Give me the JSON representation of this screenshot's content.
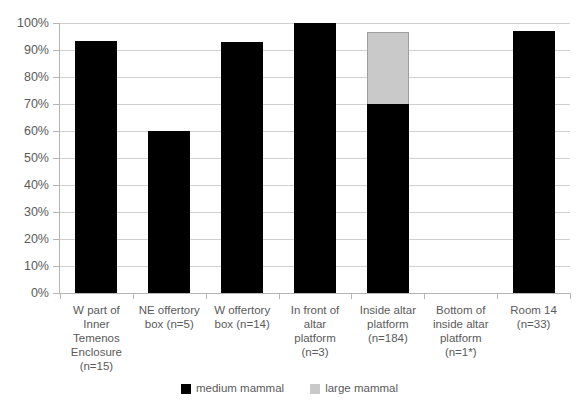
{
  "chart_data": {
    "type": "bar",
    "subtype": "stacked-column",
    "title": "",
    "subtitle": "",
    "xlabel": "",
    "ylabel": "",
    "ylim": [
      0,
      100
    ],
    "y_unit": "%",
    "grid": true,
    "legend_position": "bottom",
    "categories": [
      "W part of Inner Temenos Enclosure (n=15)",
      "NE offertory box (n=5)",
      "W offertory box (n=14)",
      "In front of altar platform (n=3)",
      "Inside altar platform (n=184)",
      "Bottom of inside altar platform (n=1*)",
      "Room 14 (n=33)"
    ],
    "category_lines": [
      [
        "W part of",
        "Inner",
        "Temenos",
        "Enclosure",
        "(n=15)"
      ],
      [
        "NE offertory",
        "box (n=5)"
      ],
      [
        "W offertory",
        "box (n=14)"
      ],
      [
        "In front of",
        "altar",
        "platform",
        "(n=3)"
      ],
      [
        "Inside altar",
        "platform",
        "(n=184)"
      ],
      [
        "Bottom of",
        "inside altar",
        "platform",
        "(n=1*)"
      ],
      [
        "Room 14",
        "(n=33)"
      ]
    ],
    "series": [
      {
        "name": "medium mammal",
        "color": "#000000",
        "values": [
          93.3,
          60.0,
          92.9,
          100.0,
          70.0,
          0.0,
          97.0
        ]
      },
      {
        "name": "large mammal",
        "color": "#c9c9c9",
        "values": [
          0.0,
          0.0,
          0.0,
          0.0,
          26.6,
          0.0,
          0.0
        ]
      }
    ],
    "y_ticks": [
      0,
      10,
      20,
      30,
      40,
      50,
      60,
      70,
      80,
      90,
      100
    ],
    "y_tick_labels": [
      "0%",
      "10%",
      "20%",
      "30%",
      "40%",
      "50%",
      "60%",
      "70%",
      "80%",
      "90%",
      "100%"
    ]
  },
  "legend": {
    "items": [
      {
        "label": "medium mammal",
        "swatch": "legend-swatch-medium"
      },
      {
        "label": "large mammal",
        "swatch": "legend-swatch-large"
      }
    ]
  },
  "colors": {
    "medium_mammal": "#000000",
    "large_mammal": "#c9c9c9",
    "gridline": "#d0d0d0",
    "axis": "#b5b5b5",
    "text": "#5a5a5a",
    "background": "#ffffff"
  }
}
